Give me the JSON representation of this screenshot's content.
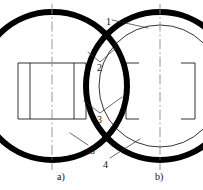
{
  "figure": {
    "type": "technical-line-drawing",
    "background_color": "#ffffff",
    "line_color": "#000000",
    "thick_wall_width_px": 6,
    "thin_line_width_px": 0.8,
    "centerline_style": "dash-dot"
  },
  "callouts": [
    {
      "id": "c1",
      "text": "1",
      "x": 106,
      "y": 17
    },
    {
      "id": "c2",
      "text": "2",
      "x": 97,
      "y": 63
    },
    {
      "id": "c3",
      "text": "3",
      "x": 97,
      "y": 115
    },
    {
      "id": "c4",
      "text": "4",
      "x": 103,
      "y": 160
    },
    {
      "id": "c5",
      "text": "5",
      "x": 90,
      "y": 146
    }
  ],
  "captions": [
    {
      "id": "a",
      "text": "a)",
      "x": 57,
      "y": 172
    },
    {
      "id": "b",
      "text": "b)",
      "x": 155,
      "y": 172
    }
  ],
  "views": {
    "left": {
      "name": "a",
      "center_x": 52,
      "outer": {
        "x": 14,
        "y": 12,
        "width": 77,
        "height": 148,
        "radius": 38
      },
      "interior_grid": {
        "top_line_y": 63,
        "bottom_line_y": 119,
        "left_x": 18,
        "right_x": 86,
        "vertical_dividers_x": [
          30,
          74
        ]
      }
    },
    "right": {
      "name": "b",
      "center_x": 160,
      "outer": {
        "x": 121,
        "y": 12,
        "width": 78,
        "height": 148,
        "radius": 39
      },
      "inner_capsule": {
        "x": 139,
        "y": 25,
        "width": 42,
        "height": 122,
        "radius": 21
      },
      "side_panels": {
        "top_line_y": 63,
        "bottom_line_y": 119,
        "left_x": 126,
        "right_x": 195
      }
    }
  }
}
